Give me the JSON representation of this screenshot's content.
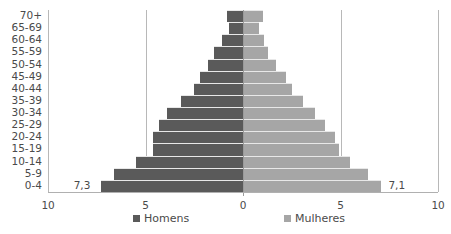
{
  "chart_data": {
    "type": "bar",
    "orientation": "horizontal",
    "subtype": "population-pyramid",
    "title": "",
    "categories": [
      "0-4",
      "5-9",
      "10-14",
      "15-19",
      "20-24",
      "25-29",
      "30-34",
      "35-39",
      "40-44",
      "45-49",
      "50-54",
      "55-59",
      "60-64",
      "65-69",
      "70+"
    ],
    "series": [
      {
        "name": "Homens",
        "color": "#5a5a5a",
        "side": "left",
        "values": [
          7.3,
          6.6,
          5.5,
          4.6,
          4.6,
          4.3,
          3.9,
          3.2,
          2.5,
          2.2,
          1.8,
          1.5,
          1.1,
          0.7,
          0.8
        ]
      },
      {
        "name": "Mulheres",
        "color": "#a6a6a6",
        "side": "right",
        "values": [
          7.1,
          6.4,
          5.5,
          4.9,
          4.7,
          4.2,
          3.7,
          3.1,
          2.5,
          2.2,
          1.7,
          1.3,
          1.1,
          0.8,
          1.0
        ]
      }
    ],
    "data_labels": [
      {
        "series": "Homens",
        "category": "0-4",
        "text": "7,3"
      },
      {
        "series": "Mulheres",
        "category": "0-4",
        "text": "7,1"
      }
    ],
    "xlabel": "",
    "ylabel": "",
    "x_ticks": [
      "10",
      "5",
      "0",
      "5",
      "10"
    ],
    "xlim": [
      -10,
      10
    ],
    "grid": {
      "vertical": true,
      "at": [
        -10,
        -5,
        5,
        10
      ]
    },
    "legend": {
      "position": "bottom",
      "entries": [
        "Homens",
        "Mulheres"
      ]
    }
  },
  "legend": {
    "male": "Homens",
    "female": "Mulheres"
  },
  "labels": {
    "male_0_4": "7,3",
    "female_0_4": "7,1"
  }
}
